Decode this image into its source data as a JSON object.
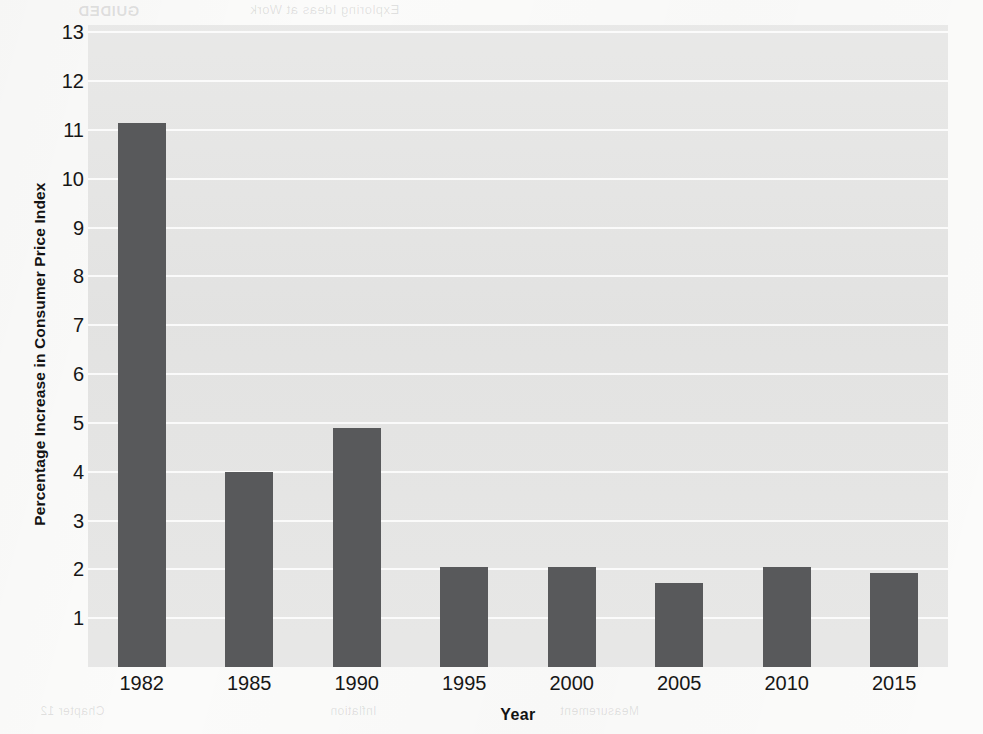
{
  "chart_data": {
    "type": "bar",
    "title": "",
    "xlabel": "Year",
    "ylabel": "Percentage Increase in Consumer Price Index",
    "categories": [
      "1982",
      "1985",
      "1990",
      "1995",
      "2000",
      "2005",
      "2010",
      "2015"
    ],
    "values": [
      11.15,
      4.0,
      4.9,
      2.05,
      2.05,
      1.72,
      2.05,
      1.93
    ],
    "ylim": [
      0,
      13.15
    ],
    "yticks": [
      1,
      2,
      3,
      4,
      5,
      6,
      7,
      8,
      9,
      10,
      11,
      12,
      13
    ],
    "ytick_labels": [
      "1",
      "2",
      "3",
      "4",
      "5",
      "6",
      "7",
      "8",
      "9",
      "10",
      "11",
      "12",
      "13"
    ],
    "grid": true,
    "grid_axis": "y",
    "legend": false,
    "legend_position": "none",
    "bar_color": "#58595b",
    "plot_background": "#e6e6e5",
    "gridline_color": "#ffffff",
    "page_background": "#fbfbfa",
    "text_color": "#161616"
  },
  "axes": {
    "y_title": "Percentage Increase in Consumer Price Index",
    "x_title": "Year"
  },
  "scan_artifacts": {
    "ghost_top_left": "GUIDED",
    "ghost_top_mid": "Exploring Ideas at Work",
    "ghost_bottom_left": "Chapter 12",
    "ghost_bottom_mid": "Inflation",
    "ghost_bottom_right": "Measurement"
  }
}
